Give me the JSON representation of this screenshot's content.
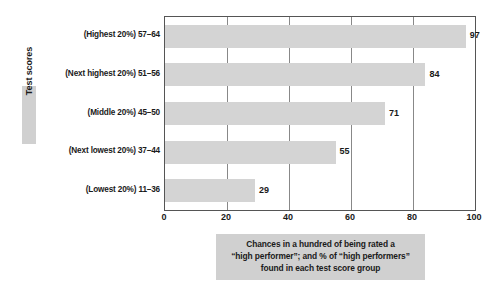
{
  "chart_data": {
    "type": "bar",
    "orientation": "horizontal",
    "title": "",
    "subtitle": "",
    "ylabel": "Test scores",
    "xlabel": "Chances in a hundred of being rated a “high performer”; and % of “high performers” found in each test score group",
    "categories": [
      "(Highest 20%) 57–64",
      "(Next highest 20%) 51–56",
      "(Middle 20%) 45–50",
      "(Next lowest 20%) 37–44",
      "(Lowest 20%) 11–36"
    ],
    "values": [
      97,
      84,
      71,
      55,
      29
    ],
    "xlim": [
      0,
      100
    ],
    "xticks": [
      0,
      20,
      40,
      60,
      80,
      100
    ],
    "grid": "vertical",
    "legend": null,
    "bar_color": "#d4d4d4",
    "accent_color": "#d0d0d0",
    "axis_color": "#555555",
    "gridline_color": "#888888"
  },
  "caption": {
    "lines": [
      "Chances in a hundred of being rated a",
      "“high performer”; and % of “high performers”",
      "found in each test score group"
    ]
  }
}
